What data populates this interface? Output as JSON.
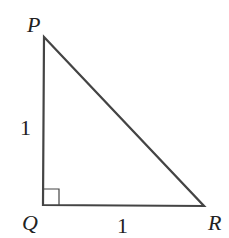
{
  "diagram": {
    "type": "right-triangle",
    "vertices": [
      {
        "name": "P",
        "label": "P",
        "x": 44,
        "y": 37
      },
      {
        "name": "Q",
        "label": "Q",
        "x": 43,
        "y": 205
      },
      {
        "name": "R",
        "label": "R",
        "x": 204,
        "y": 206
      }
    ],
    "sides": [
      {
        "name": "PQ",
        "label": "1"
      },
      {
        "name": "QR",
        "label": "1"
      }
    ],
    "right_angle_at": "Q",
    "stroke_color": "#444444"
  }
}
